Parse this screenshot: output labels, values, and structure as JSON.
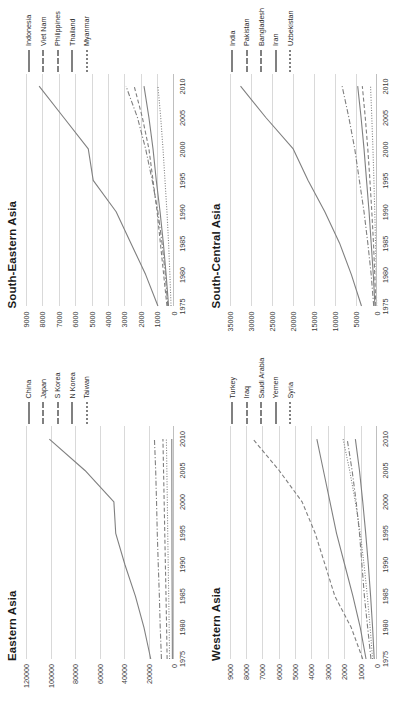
{
  "figure": {
    "orientation": "rotated-90-ccw",
    "xticks": [
      "1975",
      "1980",
      "1985",
      "1990",
      "1995",
      "2000",
      "2005",
      "2010"
    ],
    "xlim": [
      1975,
      2012
    ],
    "line_color": "#808080",
    "gridline_color": "#d9d9d9"
  },
  "chart_data": [
    {
      "type": "line",
      "panel": "top-left",
      "title": "Eastern Asia",
      "xlabel": "",
      "ylabel": "",
      "xlim": [
        1975,
        2012
      ],
      "ylim": [
        0,
        120000
      ],
      "grid": true,
      "legend_position": "right",
      "x": [
        1975,
        1980,
        1985,
        1990,
        1995,
        2000,
        2005,
        2010
      ],
      "yticks": [
        "0",
        "20000",
        "40000",
        "60000",
        "80000",
        "100000",
        "120000"
      ],
      "series": [
        {
          "name": "China",
          "dash": "solid",
          "values": [
            18500,
            24000,
            31000,
            39500,
            47000,
            48500,
            72000,
            101000
          ]
        },
        {
          "name": "Japan",
          "dash": "dashdot",
          "values": [
            9800,
            10800,
            11500,
            12400,
            13200,
            13800,
            14500,
            15500
          ]
        },
        {
          "name": "S Korea",
          "dash": "dashed",
          "values": [
            5200,
            5600,
            6100,
            6600,
            7100,
            7600,
            8100,
            8600
          ]
        },
        {
          "name": "N Korea",
          "dash": "solid",
          "values": [
            900,
            1000,
            1100,
            1200,
            1250,
            1300,
            1350,
            1400
          ]
        },
        {
          "name": "Taiwan",
          "dash": "dotted",
          "values": [
            3200,
            3500,
            3900,
            4300,
            4700,
            5000,
            5400,
            5800
          ]
        }
      ]
    },
    {
      "type": "line",
      "panel": "top-right",
      "title": "South-Eastern Asia",
      "xlabel": "",
      "ylabel": "",
      "xlim": [
        1975,
        2012
      ],
      "ylim": [
        0,
        9000
      ],
      "grid": true,
      "legend_position": "right",
      "x": [
        1975,
        1980,
        1985,
        1990,
        1995,
        2000,
        2005,
        2010
      ],
      "yticks": [
        "0",
        "1000",
        "2000",
        "3000",
        "4000",
        "5000",
        "6000",
        "7000",
        "8000",
        "9000"
      ],
      "series": [
        {
          "name": "Indonesia",
          "dash": "solid",
          "values": [
            950,
            1700,
            2600,
            3500,
            4900,
            5200,
            6700,
            8200
          ]
        },
        {
          "name": "Viet Nam",
          "dash": "dashdot",
          "values": [
            350,
            500,
            700,
            950,
            1300,
            1700,
            2200,
            2900
          ]
        },
        {
          "name": "Philippines",
          "dash": "dashed",
          "values": [
            400,
            600,
            800,
            1000,
            1250,
            1500,
            1900,
            2400
          ]
        },
        {
          "name": "Thailand",
          "dash": "solid",
          "values": [
            300,
            450,
            620,
            820,
            1050,
            1250,
            1500,
            1800
          ]
        },
        {
          "name": "Myanmar",
          "dash": "dotted",
          "values": [
            150,
            220,
            300,
            400,
            520,
            640,
            780,
            950
          ]
        }
      ]
    },
    {
      "type": "line",
      "panel": "bottom-left",
      "title": "Western Asia",
      "xlabel": "",
      "ylabel": "",
      "xlim": [
        1975,
        2012
      ],
      "ylim": [
        0,
        9000
      ],
      "grid": true,
      "legend_position": "right",
      "x": [
        1975,
        1980,
        1985,
        1990,
        1995,
        2000,
        2005,
        2010
      ],
      "yticks": [
        "0",
        "1000",
        "2000",
        "3000",
        "4000",
        "5000",
        "6000",
        "7000",
        "8000",
        "9000"
      ],
      "series": [
        {
          "name": "Turkey",
          "dash": "solid",
          "values": [
            700,
            1050,
            1500,
            2000,
            2500,
            2900,
            3300,
            3700
          ]
        },
        {
          "name": "Iraq",
          "dash": "dashdot",
          "values": [
            400,
            600,
            800,
            950,
            1100,
            1300,
            1550,
            1850
          ]
        },
        {
          "name": "Saudi Arabia",
          "dash": "dashed",
          "values": [
            900,
            1600,
            2600,
            3200,
            3800,
            4600,
            6000,
            7600
          ]
        },
        {
          "name": "Yemen",
          "dash": "solid",
          "values": [
            200,
            300,
            420,
            560,
            720,
            900,
            1100,
            1350
          ]
        },
        {
          "name": "Syria",
          "dash": "dotted",
          "values": [
            300,
            450,
            620,
            820,
            1050,
            1350,
            1700,
            2100
          ]
        }
      ]
    },
    {
      "type": "line",
      "panel": "bottom-right",
      "title": "South-Central Asia",
      "xlabel": "",
      "ylabel": "",
      "xlim": [
        1975,
        2012
      ],
      "ylim": [
        0,
        35000
      ],
      "grid": true,
      "legend_position": "right",
      "x": [
        1975,
        1980,
        1985,
        1990,
        1995,
        2000,
        2005,
        2010
      ],
      "yticks": [
        "0",
        "5000",
        "10000",
        "15000",
        "20000",
        "25000",
        "30000",
        "35000"
      ],
      "series": [
        {
          "name": "India",
          "dash": "solid",
          "values": [
            3800,
            6200,
            9000,
            12500,
            16500,
            20000,
            26500,
            32500
          ]
        },
        {
          "name": "Pakistan",
          "dash": "dashdot",
          "values": [
            900,
            1500,
            2300,
            3200,
            4300,
            5400,
            6800,
            8400
          ]
        },
        {
          "name": "Bangladesh",
          "dash": "dashed",
          "values": [
            400,
            650,
            950,
            1350,
            1800,
            2300,
            2900,
            3600
          ]
        },
        {
          "name": "Iran",
          "dash": "solid",
          "values": [
            600,
            1000,
            1500,
            2000,
            2600,
            3200,
            3900,
            4700
          ]
        },
        {
          "name": "Uzbekistan",
          "dash": "dotted",
          "values": [
            200,
            320,
            470,
            650,
            850,
            1080,
            1350,
            1650
          ]
        }
      ]
    }
  ]
}
